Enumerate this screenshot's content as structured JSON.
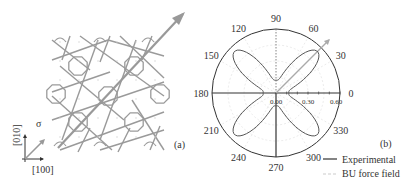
{
  "panel_a": {
    "label": "(a)",
    "stress_label": "σ",
    "axis_x_label": "[100]",
    "axis_y_label": "[010]"
  },
  "panel_b": {
    "label": "(b)"
  },
  "chart_data": {
    "type": "polar",
    "title": "",
    "angular_ticks_deg": [
      0,
      30,
      60,
      90,
      120,
      150,
      180,
      210,
      240,
      270,
      300,
      330
    ],
    "angular_tick_labels": [
      "0",
      "30",
      "60",
      "90",
      "120",
      "150",
      "180",
      "210",
      "240",
      "270",
      "300",
      "330"
    ],
    "radial_ticks": [
      0.0,
      0.3,
      0.6
    ],
    "radial_tick_labels": [
      "0.00",
      "0.30",
      "0.60"
    ],
    "rlim": [
      0,
      0.6
    ],
    "grid": true,
    "stress_direction_deg": 45,
    "legend": {
      "position": "bottom-right",
      "entries": [
        {
          "label": "Experimental",
          "style": "solid",
          "color": "#333333"
        },
        {
          "label": "BU force field",
          "style": "dashed",
          "color": "#bbbbbb"
        }
      ]
    },
    "series": [
      {
        "name": "Experimental",
        "model": "four-lobe",
        "lobe_angles_deg": [
          45,
          135,
          225,
          315
        ],
        "r_max": 0.55,
        "r_min_axes": 0.12
      }
    ],
    "colors": {
      "curve": "#555555",
      "axes": "#333333",
      "grid": "#dddddd",
      "arrow": "#aaaaaa"
    }
  }
}
